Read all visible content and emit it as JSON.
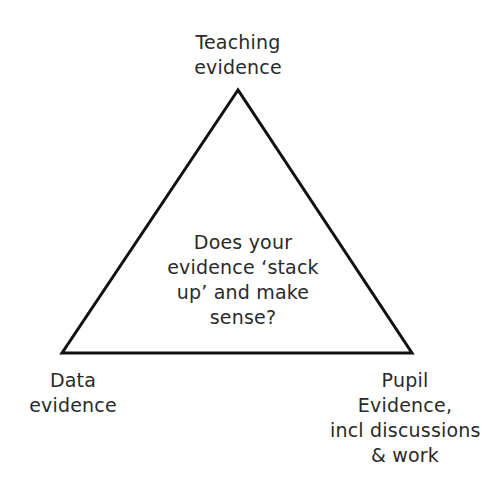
{
  "diagram": {
    "type": "triangle",
    "stroke_color": "#111111",
    "stroke_width": 3,
    "vertices": {
      "top": [
        238,
        90
      ],
      "bottom_left": [
        62,
        353
      ],
      "bottom_right": [
        412,
        353
      ]
    },
    "top_label": [
      "Teaching",
      "evidence"
    ],
    "center_label": [
      "Does your",
      "evidence ‘stack",
      "up’ and make",
      "sense?"
    ],
    "bottom_left_label": [
      "Data",
      "evidence"
    ],
    "bottom_right_label": [
      "Pupil",
      "Evidence,",
      "incl discussions",
      "& work"
    ]
  }
}
